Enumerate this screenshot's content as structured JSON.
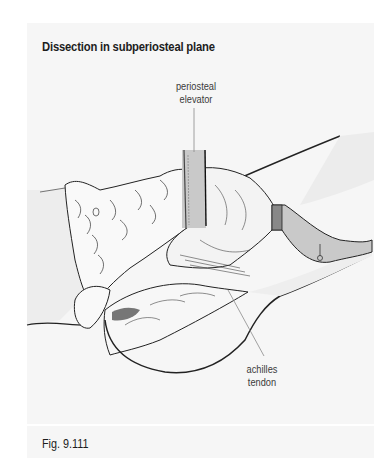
{
  "figure": {
    "title": "Dissection in subperiosteal plane",
    "caption": "Fig. 9.111",
    "labels": {
      "periosteal_elevator_line1": "periosteal",
      "periosteal_elevator_line2": "elevator",
      "achilles_tendon_line1": "achilles",
      "achilles_tendon_line2": "tendon"
    },
    "colors": {
      "panel_background": "#f6f6f6",
      "instrument_fill": "#c9c9c9",
      "line_art": "#222222",
      "leader_line": "#8a8a8a"
    },
    "instruments": [
      {
        "name": "periosteal elevator",
        "icon": "elevator-instrument"
      },
      {
        "name": "retractor",
        "icon": "retractor-instrument"
      }
    ]
  }
}
